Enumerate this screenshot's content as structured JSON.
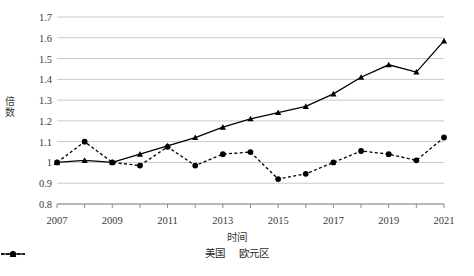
{
  "chart_data": {
    "type": "line",
    "title": "",
    "xlabel": "时间",
    "ylabel": "倍数",
    "x": [
      2007,
      2008,
      2009,
      2010,
      2011,
      2012,
      2013,
      2014,
      2015,
      2016,
      2017,
      2018,
      2019,
      2020,
      2021
    ],
    "xtick_labels": [
      "2007",
      "2009",
      "2011",
      "2013",
      "2015",
      "2017",
      "2019",
      "2021"
    ],
    "xtick_values": [
      2007,
      2009,
      2011,
      2013,
      2015,
      2017,
      2019,
      2021
    ],
    "xlim": [
      2007,
      2021
    ],
    "ylim": [
      0.8,
      1.7
    ],
    "ytick_labels": [
      "0.8",
      "0.9",
      "1",
      "1.1",
      "1.2",
      "1.3",
      "1.4",
      "1.5",
      "1.6",
      "1.7"
    ],
    "ytick_values": [
      0.8,
      0.9,
      1.0,
      1.1,
      1.2,
      1.3,
      1.4,
      1.5,
      1.6,
      1.7
    ],
    "grid": true,
    "legend_position": "bottom",
    "series": [
      {
        "name": "美国",
        "marker": "triangle",
        "linestyle": "solid",
        "color": "#000000",
        "values": [
          1.0,
          1.01,
          1.0,
          1.04,
          1.08,
          1.12,
          1.17,
          1.21,
          1.24,
          1.27,
          1.33,
          1.41,
          1.47,
          1.435,
          1.585
        ]
      },
      {
        "name": "欧元区",
        "marker": "circle",
        "linestyle": "dashed",
        "color": "#000000",
        "values": [
          1.0,
          1.1,
          1.0,
          0.985,
          1.075,
          0.985,
          1.04,
          1.05,
          0.92,
          0.945,
          1.0,
          1.055,
          1.04,
          1.01,
          1.12
        ]
      }
    ]
  },
  "legend": {
    "items": [
      {
        "label": "美国",
        "marker": "triangle",
        "linestyle": "solid"
      },
      {
        "label": "欧元区",
        "marker": "circle",
        "linestyle": "dashed"
      }
    ]
  }
}
